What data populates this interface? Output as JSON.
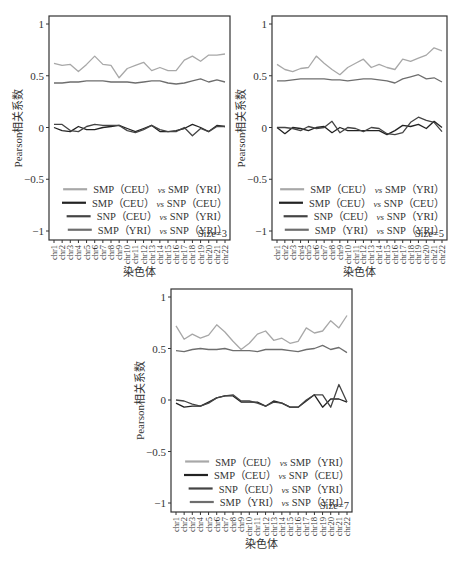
{
  "chart_data": [
    {
      "type": "line",
      "panel": "top-left",
      "title": "",
      "xlabel": "染色体",
      "ylabel": "Pearson相关系数",
      "ylim": [
        -1,
        1
      ],
      "yticks": [
        1,
        0.5,
        0,
        -0.5,
        -1
      ],
      "ytick_labels": [
        "1",
        "0.5",
        "0",
        "−0.5",
        "−1"
      ],
      "grid": false,
      "legend_position": "lower right",
      "annotation": "Size=3",
      "categories": [
        "chr1",
        "chr2",
        "chr3",
        "chr4",
        "chr5",
        "chr6",
        "chr7",
        "chr8",
        "chr9",
        "chr10",
        "chr11",
        "chr12",
        "chr13",
        "chr14",
        "chr15",
        "chr16",
        "chr17",
        "chr18",
        "chr19",
        "chr20",
        "chr21",
        "chr22"
      ],
      "series": [
        {
          "name": "SMP（CEU）vs SMP（YRI）",
          "color": "#a8a8a8",
          "values": [
            0.62,
            0.6,
            0.61,
            0.54,
            0.61,
            0.69,
            0.61,
            0.6,
            0.48,
            0.57,
            0.6,
            0.63,
            0.55,
            0.58,
            0.55,
            0.55,
            0.65,
            0.69,
            0.64,
            0.7,
            0.7,
            0.71
          ]
        },
        {
          "name": "SMP（CEU）vs SNP（CEU）",
          "color": "#222222",
          "values": [
            0.0,
            -0.03,
            -0.04,
            0.01,
            -0.02,
            -0.02,
            0.0,
            0.01,
            0.02,
            -0.01,
            -0.04,
            -0.01,
            0.02,
            -0.04,
            -0.04,
            -0.03,
            -0.01,
            0.03,
            0.0,
            -0.04,
            0.02,
            0.01
          ]
        },
        {
          "name": "SNP（CEU）vs SNP（YRI）",
          "color": "#444444",
          "values": [
            0.03,
            0.03,
            -0.03,
            -0.04,
            0.01,
            0.03,
            0.02,
            0.02,
            0.02,
            -0.03,
            -0.05,
            -0.02,
            0.02,
            -0.02,
            -0.04,
            -0.04,
            0.0,
            -0.08,
            -0.01,
            -0.04,
            0.01,
            0.01
          ]
        },
        {
          "name": "SMP（YRI）vs SNP（YRI）",
          "color": "#6e6e6e",
          "values": [
            0.43,
            0.43,
            0.44,
            0.44,
            0.45,
            0.45,
            0.45,
            0.44,
            0.44,
            0.44,
            0.43,
            0.44,
            0.45,
            0.45,
            0.43,
            0.42,
            0.43,
            0.45,
            0.47,
            0.44,
            0.46,
            0.44
          ]
        }
      ]
    },
    {
      "type": "line",
      "panel": "top-right",
      "title": "",
      "xlabel": "染色体",
      "ylabel": "Pearson相关系数",
      "ylim": [
        -1,
        1
      ],
      "yticks": [
        1,
        0.5,
        0,
        -0.5,
        -1
      ],
      "ytick_labels": [
        "1",
        "0.5",
        "0",
        "−0.5",
        "−1"
      ],
      "grid": false,
      "legend_position": "lower right",
      "annotation": "Size=5",
      "categories": [
        "chr1",
        "chr2",
        "chr3",
        "chr4",
        "chr5",
        "chr6",
        "chr7",
        "chr8",
        "chr9",
        "chr10",
        "chr11",
        "chr12",
        "chr13",
        "chr14",
        "chr15",
        "chr16",
        "chr17",
        "chr18",
        "chr19",
        "chr20",
        "chr21",
        "chr22"
      ],
      "series": [
        {
          "name": "SMP（CEU）vs SMP（YRI）",
          "color": "#a8a8a8",
          "values": [
            0.61,
            0.56,
            0.54,
            0.57,
            0.58,
            0.69,
            0.62,
            0.56,
            0.51,
            0.58,
            0.62,
            0.66,
            0.58,
            0.61,
            0.58,
            0.56,
            0.66,
            0.64,
            0.67,
            0.7,
            0.77,
            0.74
          ]
        },
        {
          "name": "SMP（CEU）vs SNP（CEU）",
          "color": "#222222",
          "values": [
            0.0,
            -0.06,
            0.0,
            -0.01,
            -0.03,
            0.0,
            0.01,
            -0.05,
            0.0,
            -0.03,
            -0.03,
            -0.03,
            -0.03,
            -0.03,
            -0.07,
            -0.03,
            0.02,
            0.01,
            0.03,
            -0.01,
            0.06,
            0.0
          ]
        },
        {
          "name": "SNP（CEU）vs SNP（YRI）",
          "color": "#444444",
          "values": [
            0.0,
            0.0,
            -0.01,
            -0.03,
            0.01,
            -0.01,
            0.0,
            0.06,
            -0.05,
            0.0,
            -0.01,
            -0.04,
            0.0,
            -0.01,
            -0.06,
            -0.07,
            -0.05,
            0.05,
            0.1,
            0.07,
            0.05,
            -0.04
          ]
        },
        {
          "name": "SMP（YRI）vs SNP（YRI）",
          "color": "#6e6e6e",
          "values": [
            0.45,
            0.45,
            0.46,
            0.47,
            0.47,
            0.47,
            0.47,
            0.46,
            0.46,
            0.45,
            0.46,
            0.47,
            0.47,
            0.46,
            0.45,
            0.43,
            0.47,
            0.49,
            0.51,
            0.47,
            0.48,
            0.44
          ]
        }
      ]
    },
    {
      "type": "line",
      "panel": "bottom-center",
      "title": "",
      "xlabel": "染色体",
      "ylabel": "Pearson相关系数",
      "ylim": [
        -1,
        1
      ],
      "yticks": [
        1,
        0.5,
        0,
        -0.5,
        -1
      ],
      "ytick_labels": [
        "1",
        "0.5",
        "0",
        "−0.5",
        "−1"
      ],
      "grid": false,
      "legend_position": "lower right",
      "annotation": "Size=7",
      "categories": [
        "chr1",
        "chr2",
        "chr3",
        "chr4",
        "chr5",
        "chr6",
        "chr7",
        "chr8",
        "chr9",
        "chr10",
        "chr11",
        "chr12",
        "chr13",
        "chr14",
        "chr15",
        "chr16",
        "chr17",
        "chr18",
        "chr19",
        "chr20",
        "chr21",
        "chr22"
      ],
      "series": [
        {
          "name": "SMP（CEU）vs SMP（YRI）",
          "color": "#a8a8a8",
          "values": [
            0.72,
            0.59,
            0.64,
            0.6,
            0.63,
            0.73,
            0.66,
            0.57,
            0.49,
            0.55,
            0.64,
            0.67,
            0.58,
            0.6,
            0.55,
            0.57,
            0.7,
            0.65,
            0.67,
            0.77,
            0.7,
            0.82
          ]
        },
        {
          "name": "SMP（CEU）vs SNP（CEU）",
          "color": "#222222",
          "values": [
            -0.03,
            -0.07,
            -0.06,
            -0.06,
            -0.02,
            0.02,
            0.04,
            0.04,
            -0.02,
            -0.02,
            -0.02,
            -0.06,
            -0.01,
            -0.03,
            -0.07,
            -0.07,
            -0.01,
            0.05,
            -0.07,
            0.01,
            0.01,
            -0.02
          ]
        },
        {
          "name": "SNP（CEU）vs SNP（YRI）",
          "color": "#444444",
          "values": [
            0.0,
            -0.01,
            -0.04,
            -0.06,
            -0.03,
            0.02,
            0.04,
            0.05,
            -0.01,
            -0.01,
            -0.03,
            -0.06,
            -0.02,
            -0.03,
            -0.07,
            -0.07,
            0.0,
            0.05,
            0.05,
            -0.07,
            0.15,
            -0.02
          ]
        },
        {
          "name": "SMP（YRI）vs SNP（YRI）",
          "color": "#6e6e6e",
          "values": [
            0.48,
            0.47,
            0.49,
            0.5,
            0.49,
            0.49,
            0.5,
            0.48,
            0.48,
            0.48,
            0.47,
            0.49,
            0.49,
            0.49,
            0.48,
            0.47,
            0.49,
            0.5,
            0.53,
            0.49,
            0.51,
            0.46
          ]
        }
      ]
    }
  ],
  "panels": [
    {
      "x": 0,
      "y": 0,
      "width": 231,
      "height": 280,
      "plot": {
        "left": 49,
        "top": 16,
        "right": 230,
        "bottom": 240
      }
    },
    {
      "x": 231,
      "y": 0,
      "width": 231,
      "height": 280,
      "plot": {
        "left": 41,
        "top": 16,
        "right": 216,
        "bottom": 240
      }
    },
    {
      "x": 115,
      "y": 280,
      "width": 240,
      "height": 285,
      "plot": {
        "left": 56,
        "top": 9,
        "right": 237,
        "bottom": 232
      }
    }
  ]
}
